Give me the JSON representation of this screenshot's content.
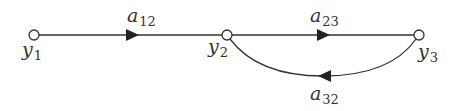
{
  "diagram": {
    "type": "signal-flow-graph",
    "colors": {
      "stroke": "#333333",
      "node_fill": "#ffffff",
      "background": "#ffffff"
    },
    "nodes": [
      {
        "id": "y1",
        "base": "y",
        "sub": "1"
      },
      {
        "id": "y2",
        "base": "y",
        "sub": "2"
      },
      {
        "id": "y3",
        "base": "y",
        "sub": "3"
      }
    ],
    "edges": [
      {
        "from": "y1",
        "to": "y2",
        "base": "a",
        "sub": "12"
      },
      {
        "from": "y2",
        "to": "y3",
        "base": "a",
        "sub": "23"
      },
      {
        "from": "y3",
        "to": "y2",
        "base": "a",
        "sub": "32"
      }
    ]
  }
}
